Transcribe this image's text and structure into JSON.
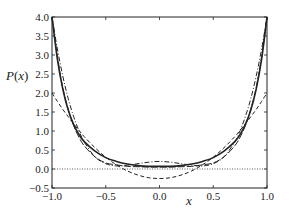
{
  "chart_data": {
    "type": "line",
    "title": "",
    "xlabel": "x",
    "ylabel": "P(x)",
    "xlim": [
      -1.0,
      1.0
    ],
    "ylim": [
      -0.5,
      4.0
    ],
    "grid": false,
    "legend": null,
    "x_ticks": [
      "-1.0",
      "-0.5",
      "0.0",
      "0.5",
      "1.0"
    ],
    "y_ticks": [
      "4.0",
      "3.5",
      "3.0",
      "2.5",
      "2.0",
      "1.5",
      "1.0",
      "0.5",
      "0.0",
      "-0.5"
    ],
    "reference_line": {
      "y": 0.0,
      "style": "dotted"
    },
    "x": [
      -1.0,
      -0.95,
      -0.9,
      -0.85,
      -0.8,
      -0.75,
      -0.7,
      -0.6,
      -0.5,
      -0.4,
      -0.3,
      -0.2,
      -0.1,
      0.0,
      0.1,
      0.2,
      0.3,
      0.4,
      0.5,
      0.6,
      0.7,
      0.75,
      0.8,
      0.85,
      0.9,
      0.95,
      1.0
    ],
    "series": [
      {
        "name": "solid",
        "style": "solid",
        "width": 1.6,
        "values": [
          4.0,
          2.89,
          2.11,
          1.56,
          1.18,
          0.91,
          0.72,
          0.47,
          0.3,
          0.2,
          0.13,
          0.09,
          0.07,
          0.07,
          0.07,
          0.09,
          0.13,
          0.2,
          0.3,
          0.47,
          0.72,
          0.91,
          1.18,
          1.56,
          2.11,
          2.89,
          4.0
        ]
      },
      {
        "name": "dashed",
        "style": "dashed",
        "width": 1.0,
        "values": [
          2.0,
          1.78,
          1.57,
          1.38,
          1.19,
          1.02,
          0.85,
          0.56,
          0.31,
          0.11,
          -0.05,
          -0.16,
          -0.23,
          -0.25,
          -0.23,
          -0.16,
          -0.05,
          0.11,
          0.31,
          0.56,
          0.85,
          1.02,
          1.19,
          1.38,
          1.57,
          1.78,
          2.0
        ]
      },
      {
        "name": "dash-dot",
        "style": "dashdot",
        "width": 1.0,
        "values": [
          4.0,
          3.16,
          2.45,
          1.86,
          1.39,
          1.01,
          0.71,
          0.32,
          0.14,
          0.08,
          0.1,
          0.14,
          0.18,
          0.2,
          0.18,
          0.14,
          0.1,
          0.08,
          0.14,
          0.32,
          0.71,
          1.01,
          1.39,
          1.86,
          2.45,
          3.16,
          4.0
        ]
      },
      {
        "name": "long-dash",
        "style": "longdash",
        "width": 1.0,
        "values": [
          4.0,
          2.96,
          2.15,
          1.58,
          1.15,
          0.84,
          0.61,
          0.32,
          0.16,
          0.11,
          0.07,
          0.06,
          0.05,
          0.05,
          0.05,
          0.06,
          0.07,
          0.11,
          0.16,
          0.32,
          0.61,
          0.84,
          1.15,
          1.58,
          2.15,
          2.96,
          4.0
        ]
      }
    ]
  },
  "labels": {
    "xlabel": "x",
    "ylabel": "P(x)"
  }
}
